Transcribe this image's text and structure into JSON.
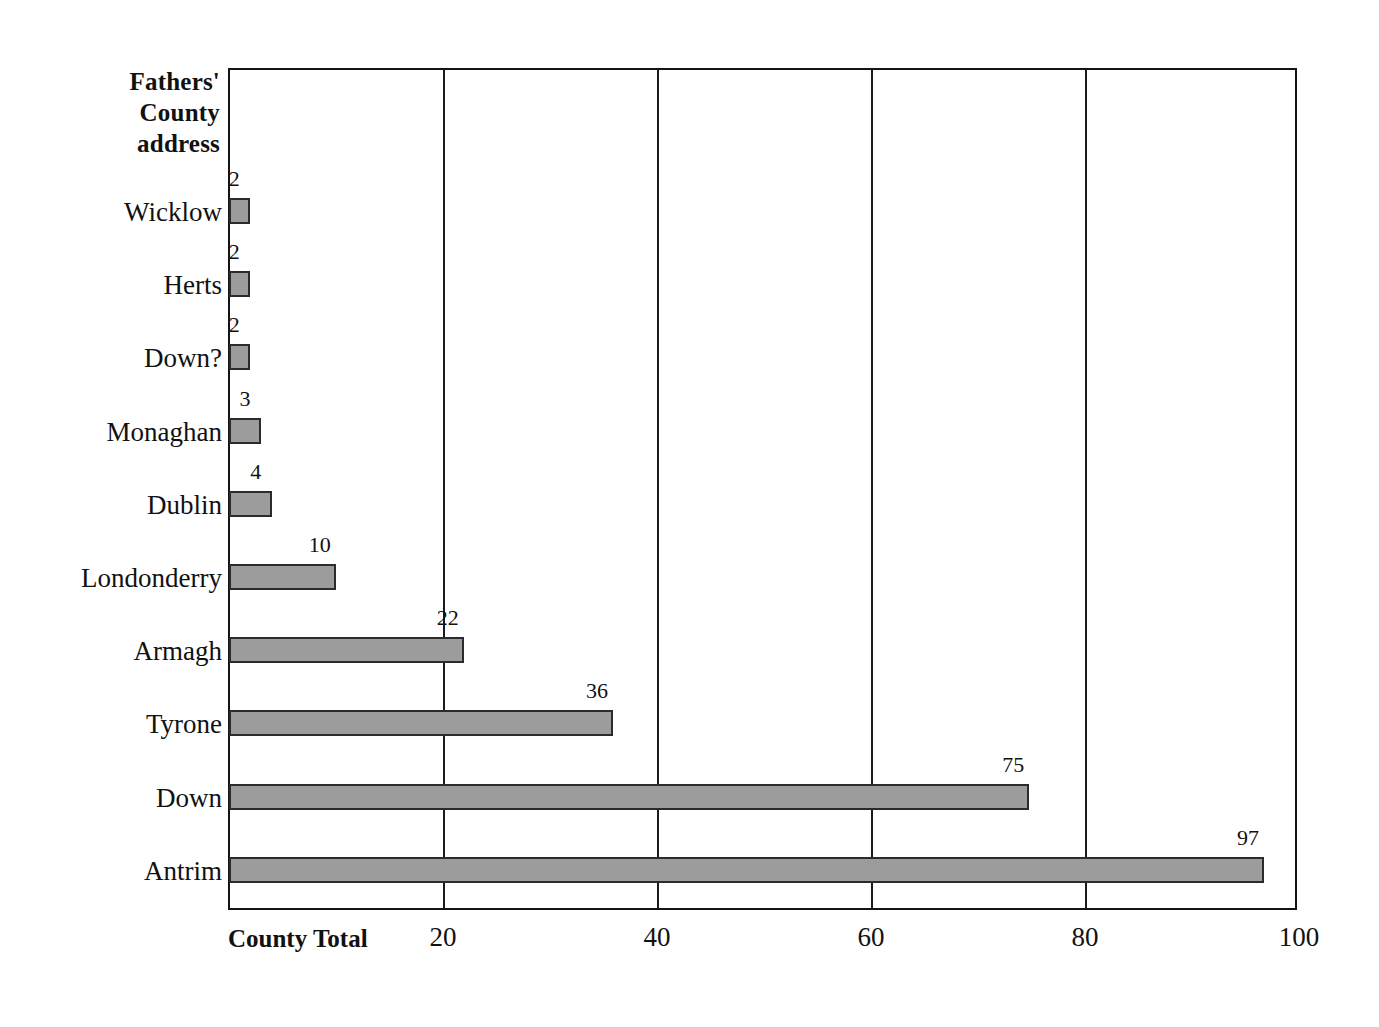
{
  "chart_data": {
    "type": "bar",
    "orientation": "horizontal",
    "title": "",
    "category_axis_title_lines": [
      "Fathers'",
      "County",
      "address"
    ],
    "value_axis_title": "County Total",
    "xlabel": "County Total",
    "ylabel": "Fathers' County address",
    "categories": [
      "Wicklow",
      "Herts",
      "Down?",
      "Monaghan",
      "Dublin",
      "Londonderry",
      "Armagh",
      "Tyrone",
      "Down",
      "Antrim"
    ],
    "values": [
      2,
      2,
      2,
      3,
      4,
      10,
      22,
      36,
      75,
      97
    ],
    "data_labels": [
      "2",
      "2",
      "2",
      "3",
      "4",
      "10",
      "22",
      "36",
      "75",
      "97"
    ],
    "xlim": [
      0,
      100
    ],
    "x_ticks": [
      20,
      40,
      60,
      80,
      100
    ],
    "x_tick_labels": [
      "20",
      "40",
      "60",
      "80",
      "100"
    ],
    "gridlines": "vertical at each x tick",
    "legend": "none",
    "bar_fill_color": "#9c9c9c",
    "bar_border_color": "#2b2b2b",
    "axis_color": "#141414",
    "background_color": "#ffffff"
  },
  "bars": [
    {
      "label": "Wicklow",
      "value": 2,
      "value_label": "2"
    },
    {
      "label": "Herts",
      "value": 2,
      "value_label": "2"
    },
    {
      "label": "Down?",
      "value": 2,
      "value_label": "2"
    },
    {
      "label": "Monaghan",
      "value": 3,
      "value_label": "3"
    },
    {
      "label": "Dublin",
      "value": 4,
      "value_label": "4"
    },
    {
      "label": "Londonderry",
      "value": 10,
      "value_label": "10"
    },
    {
      "label": "Armagh",
      "value": 22,
      "value_label": "22"
    },
    {
      "label": "Tyrone",
      "value": 36,
      "value_label": "36"
    },
    {
      "label": "Down",
      "value": 75,
      "value_label": "75"
    },
    {
      "label": "Antrim",
      "value": 97,
      "value_label": "97"
    }
  ],
  "axis": {
    "category_title_lines": [
      "Fathers'",
      "County",
      "address"
    ],
    "value_title": "County Total",
    "x_tick_labels": [
      "20",
      "40",
      "60",
      "80",
      "100"
    ]
  }
}
